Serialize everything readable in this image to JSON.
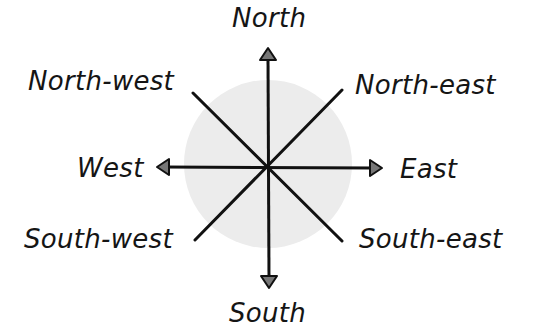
{
  "diagram": {
    "type": "compass-rose",
    "points": {
      "north": "North",
      "north_east": "North-east",
      "east": "East",
      "south_east": "South-east",
      "south": "South",
      "south_west": "South-west",
      "west": "West",
      "north_west": "North-west"
    },
    "colors": {
      "background": "#ffffff",
      "circle_fill": "#ececec",
      "line": "#111111",
      "arrowhead_fill": "#777777",
      "text": "#151515"
    }
  }
}
